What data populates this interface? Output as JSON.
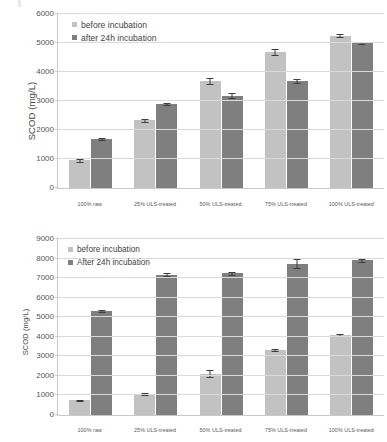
{
  "figure": {
    "panels": [
      {
        "id": "top",
        "ylabel": "SCOD (mg/L)",
        "legend": [
          "before incubation",
          "after 24h incubation"
        ],
        "yticks": [
          "0",
          "1000",
          "2000",
          "3000",
          "4000",
          "5000",
          "6000"
        ],
        "xlabels": [
          "100% raw",
          "25% ULS-treated",
          "50% ULS-treated",
          "75% ULS-treated",
          "100% ULS-treated"
        ]
      },
      {
        "id": "bottom",
        "ylabel": "SCOD (mg/L)",
        "legend": [
          "before incubation",
          "After 24h incubation"
        ],
        "yticks": [
          "0",
          "1000",
          "2000",
          "3000",
          "4000",
          "5000",
          "6000",
          "7000",
          "8000",
          "9000"
        ],
        "xlabels": [
          "100% raw",
          "25% ULS-treated",
          "50% ULS-treated",
          "75% ULS-treated",
          "100% ULS-treated"
        ]
      }
    ],
    "colors": {
      "series_before": "#c2c2c2",
      "series_after": "#7f7f7f",
      "gridline": "#dadada",
      "axis": "#c9c9c9",
      "text": "#3f3f3f"
    }
  },
  "chart_data": [
    {
      "type": "bar",
      "title": "",
      "xlabel": "",
      "ylabel": "SCOD (mg/L)",
      "ylim": [
        0,
        6000
      ],
      "ytick_step": 1000,
      "grid": true,
      "legend_position": "top-left",
      "categories": [
        "100% raw",
        "25% ULS-treated",
        "50% ULS-treated",
        "75% ULS-treated",
        "100% ULS-treated"
      ],
      "series": [
        {
          "name": "before incubation",
          "color": "#c2c2c2",
          "values": [
            950,
            2330,
            3700,
            4700,
            5250
          ],
          "errors": [
            40,
            45,
            110,
            110,
            55
          ]
        },
        {
          "name": "after 24h incubation",
          "color": "#7f7f7f",
          "values": [
            1680,
            2890,
            3180,
            3690,
            5000
          ],
          "errors": [
            35,
            40,
            90,
            70,
            35
          ]
        }
      ]
    },
    {
      "type": "bar",
      "title": "",
      "xlabel": "",
      "ylabel": "SCOD (mg/L)",
      "ylim": [
        0,
        9000
      ],
      "ytick_step": 1000,
      "grid": true,
      "legend_position": "top-left",
      "categories": [
        "100% raw",
        "25% ULS-treated",
        "50% ULS-treated",
        "75% ULS-treated",
        "100% ULS-treated"
      ],
      "series": [
        {
          "name": "before incubation",
          "color": "#c2c2c2",
          "values": [
            760,
            1070,
            2100,
            3340,
            4080
          ],
          "errors": [
            30,
            40,
            180,
            50,
            50
          ]
        },
        {
          "name": "After 24h incubation",
          "color": "#7f7f7f",
          "values": [
            5330,
            7170,
            7240,
            7740,
            7920
          ],
          "errors": [
            45,
            75,
            60,
            230,
            80
          ]
        }
      ]
    }
  ]
}
